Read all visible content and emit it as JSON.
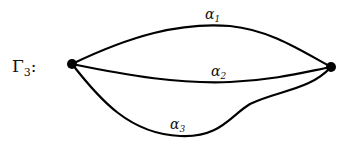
{
  "graph": {
    "name": "Γ",
    "name_subscript": "3",
    "name_suffix": ":",
    "nodes": [
      {
        "id": "left",
        "x": 72,
        "y": 64
      },
      {
        "id": "right",
        "x": 331,
        "y": 67
      }
    ],
    "edges": [
      {
        "id": "alpha1",
        "label": "α",
        "subscript": "1"
      },
      {
        "id": "alpha2",
        "label": "α",
        "subscript": "2"
      },
      {
        "id": "alpha3",
        "label": "α",
        "subscript": "3"
      }
    ]
  }
}
